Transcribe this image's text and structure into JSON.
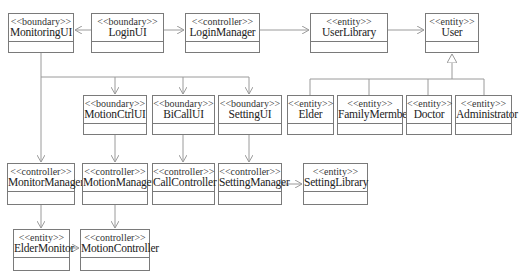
{
  "diagram": {
    "type": "uml-class-diagram",
    "line_color": "#9a9a9a",
    "border_color": "#7a7a7a",
    "classes": [
      {
        "id": "MonitoringUI",
        "stereotype": "<<boundary>>",
        "name": "MonitoringUI",
        "x": 8,
        "y": 13,
        "w": 66,
        "h": 40
      },
      {
        "id": "LoginUI",
        "stereotype": "<<boundary>>",
        "name": "LoginUI",
        "x": 91,
        "y": 13,
        "w": 73,
        "h": 40
      },
      {
        "id": "LoginManager",
        "stereotype": "<<controller>>",
        "name": "LoginManager",
        "x": 185,
        "y": 13,
        "w": 75,
        "h": 40
      },
      {
        "id": "UserLibrary",
        "stereotype": "<<entity>>",
        "name": "UserLibrary",
        "x": 310,
        "y": 13,
        "w": 78,
        "h": 40
      },
      {
        "id": "User",
        "stereotype": "<<entity>>",
        "name": "User",
        "x": 425,
        "y": 13,
        "w": 54,
        "h": 40
      },
      {
        "id": "MotionCtrlUI",
        "stereotype": "<<boundary>>",
        "name": "MotionCtrlUI",
        "x": 83,
        "y": 95,
        "w": 64,
        "h": 40
      },
      {
        "id": "BiCallUI",
        "stereotype": "<<boundary>>",
        "name": "BiCallUI",
        "x": 152,
        "y": 95,
        "w": 63,
        "h": 40
      },
      {
        "id": "SettingUI",
        "stereotype": "<<boundary>>",
        "name": "SettingUI",
        "x": 218,
        "y": 95,
        "w": 64,
        "h": 40
      },
      {
        "id": "Elder",
        "stereotype": "<<entity>>",
        "name": "Elder",
        "x": 287,
        "y": 95,
        "w": 47,
        "h": 40
      },
      {
        "id": "FamilyMermber",
        "stereotype": "<<entity>>",
        "name": "FamilyMermber",
        "x": 337,
        "y": 95,
        "w": 66,
        "h": 40
      },
      {
        "id": "Doctor",
        "stereotype": "<<entity>>",
        "name": "Doctor",
        "x": 406,
        "y": 95,
        "w": 46,
        "h": 40
      },
      {
        "id": "Administrator",
        "stereotype": "<<entity>>",
        "name": "Administrator",
        "x": 455,
        "y": 95,
        "w": 57,
        "h": 40
      },
      {
        "id": "MonitorManager",
        "stereotype": "<<controller>>",
        "name": "MonitorManager",
        "x": 7,
        "y": 163,
        "w": 68,
        "h": 42
      },
      {
        "id": "MotionManager",
        "stereotype": "<<controller>>",
        "name": "MotionManager",
        "x": 82,
        "y": 163,
        "w": 66,
        "h": 42
      },
      {
        "id": "CallController",
        "stereotype": "<<controller>>",
        "name": "CallController",
        "x": 152,
        "y": 163,
        "w": 63,
        "h": 42
      },
      {
        "id": "SettingManager",
        "stereotype": "<<controller>>",
        "name": "SettingManager",
        "x": 218,
        "y": 163,
        "w": 64,
        "h": 42
      },
      {
        "id": "SettingLibrary",
        "stereotype": "<<entity>>",
        "name": "SettingLibrary",
        "x": 303,
        "y": 163,
        "w": 65,
        "h": 42
      },
      {
        "id": "ElderMonitor",
        "stereotype": "<<entity>>",
        "name": "ElderMonitor",
        "x": 13,
        "y": 229,
        "w": 57,
        "h": 42
      },
      {
        "id": "MotionController",
        "stereotype": "<<controller>>",
        "name": "MotionController",
        "x": 80,
        "y": 229,
        "w": 70,
        "h": 42
      }
    ],
    "relations": [
      {
        "from": "LoginUI",
        "to": "MonitoringUI",
        "kind": "dependency"
      },
      {
        "from": "LoginUI",
        "to": "LoginManager",
        "kind": "dependency"
      },
      {
        "from": "LoginManager",
        "to": "UserLibrary",
        "kind": "dependency"
      },
      {
        "from": "UserLibrary",
        "to": "User",
        "kind": "dependency"
      },
      {
        "from": "Elder",
        "to": "User",
        "kind": "generalization"
      },
      {
        "from": "FamilyMermber",
        "to": "User",
        "kind": "generalization"
      },
      {
        "from": "Doctor",
        "to": "User",
        "kind": "generalization"
      },
      {
        "from": "Administrator",
        "to": "User",
        "kind": "generalization"
      },
      {
        "from": "MonitoringUI",
        "to": "MotionCtrlUI",
        "kind": "dependency"
      },
      {
        "from": "MonitoringUI",
        "to": "BiCallUI",
        "kind": "dependency"
      },
      {
        "from": "MonitoringUI",
        "to": "SettingUI",
        "kind": "dependency"
      },
      {
        "from": "MonitoringUI",
        "to": "MonitorManager",
        "kind": "dependency"
      },
      {
        "from": "MotionCtrlUI",
        "to": "MotionManager",
        "kind": "dependency"
      },
      {
        "from": "BiCallUI",
        "to": "CallController",
        "kind": "dependency"
      },
      {
        "from": "SettingUI",
        "to": "SettingManager",
        "kind": "dependency"
      },
      {
        "from": "SettingManager",
        "to": "SettingLibrary",
        "kind": "dependency"
      },
      {
        "from": "MonitorManager",
        "to": "ElderMonitor",
        "kind": "dependency"
      },
      {
        "from": "MotionManager",
        "to": "MotionController",
        "kind": "dependency"
      },
      {
        "from": "ElderMonitor",
        "to": "MotionController",
        "kind": "dependency"
      }
    ]
  }
}
